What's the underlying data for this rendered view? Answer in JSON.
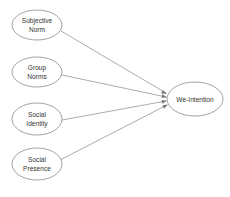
{
  "diagram": {
    "type": "path-model",
    "source_nodes": [
      {
        "id": "subjective-norm",
        "line1": "Subjective",
        "line2": "Norm"
      },
      {
        "id": "group-norms",
        "line1": "Group",
        "line2": "Norms"
      },
      {
        "id": "social-identity",
        "line1": "Social",
        "line2": "Identity"
      },
      {
        "id": "social-presence",
        "line1": "Social",
        "line2": "Presence"
      }
    ],
    "target_node": {
      "id": "we-intention",
      "label": "We-Intention"
    },
    "edges": [
      {
        "from": "subjective-norm",
        "to": "we-intention"
      },
      {
        "from": "group-norms",
        "to": "we-intention"
      },
      {
        "from": "social-identity",
        "to": "we-intention"
      },
      {
        "from": "social-presence",
        "to": "we-intention"
      }
    ],
    "colors": {
      "stroke": "#8a8a8a",
      "text": "#333333",
      "background": "#ffffff"
    }
  }
}
